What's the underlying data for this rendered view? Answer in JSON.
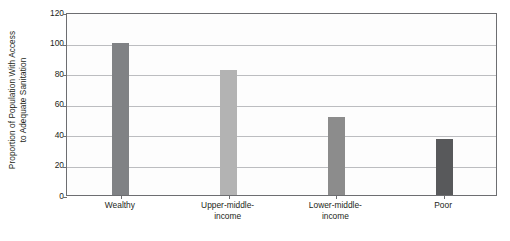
{
  "chart_data": {
    "type": "bar",
    "title": "",
    "xlabel": "",
    "ylabel_line1": "Proportion of Population With Access",
    "ylabel_line2": "to Adequate Sanitation",
    "categories": [
      "Wealthy",
      "Upper-middle-income",
      "Lower-middle-income",
      "Poor"
    ],
    "category_lines": [
      [
        "Wealthy"
      ],
      [
        "Upper-middle-",
        "income"
      ],
      [
        "Lower-middle-",
        "income"
      ],
      [
        "Poor"
      ]
    ],
    "values": [
      100,
      82,
      51,
      37
    ],
    "bar_colors": [
      "#808285",
      "#b3b3b3",
      "#8c8c8c",
      "#58595b"
    ],
    "ylim": [
      0,
      120
    ],
    "yticks": [
      0,
      20,
      40,
      60,
      80,
      100,
      120
    ],
    "ytick_labels": [
      "0",
      "20",
      "40",
      "60",
      "80",
      "100",
      "120"
    ],
    "grid": true,
    "grid_axis": "y",
    "legend": false,
    "frame_color": "#6d6e71",
    "grid_color": "#bcbdc0",
    "background": "#ffffff"
  }
}
